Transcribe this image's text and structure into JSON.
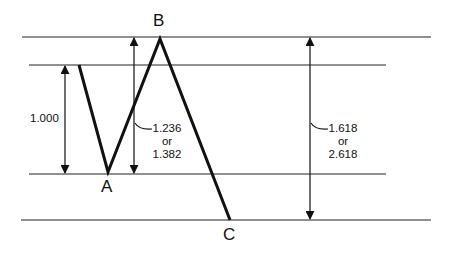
{
  "diagram": {
    "title": "",
    "points": {
      "A": "A",
      "B": "B",
      "C": "C"
    },
    "ratios": {
      "ab_leg": "1.000",
      "bc_retrace": {
        "line1": "1.236",
        "line2": "or",
        "line3": "1.382"
      },
      "cd_extension": {
        "line1": "1.618",
        "line2": "or",
        "line3": "2.618"
      }
    },
    "colors": {
      "line": "#111111",
      "background": "#ffffff"
    }
  }
}
